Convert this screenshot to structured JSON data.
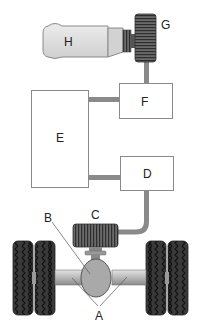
{
  "diagram": {
    "type": "drivetrain-schematic",
    "labels": {
      "A": "A",
      "B": "B",
      "C": "C",
      "D": "D",
      "E": "E",
      "F": "F",
      "G": "G",
      "H": "H"
    },
    "components": [
      {
        "id": "H",
        "shape": "cylinder-engine",
        "connects_to": [
          "G"
        ]
      },
      {
        "id": "G",
        "shape": "ribbed-drum",
        "connects_to": [
          "H",
          "F"
        ]
      },
      {
        "id": "F",
        "shape": "box",
        "connects_to": [
          "G",
          "E"
        ]
      },
      {
        "id": "E",
        "shape": "tall-box",
        "connects_to": [
          "F",
          "D"
        ]
      },
      {
        "id": "D",
        "shape": "box",
        "connects_to": [
          "E",
          "C"
        ]
      },
      {
        "id": "C",
        "shape": "ribbed-drum",
        "connects_to": [
          "D",
          "B"
        ]
      },
      {
        "id": "B",
        "shape": "differential-housing",
        "connects_to": [
          "C",
          "A"
        ]
      },
      {
        "id": "A",
        "shape": "axle-shafts",
        "connects_to": [
          "B",
          "wheels"
        ]
      }
    ],
    "colors": {
      "box_stroke": "#888888",
      "box_fill": "#ffffff",
      "connector": "#8a8a8a",
      "engine_fill": "#dcdcdc",
      "drum_fill": "#555555",
      "axle_fill": "#b5b5b5",
      "diff_fill": "#a8a8a8",
      "tire": "#333333"
    }
  }
}
